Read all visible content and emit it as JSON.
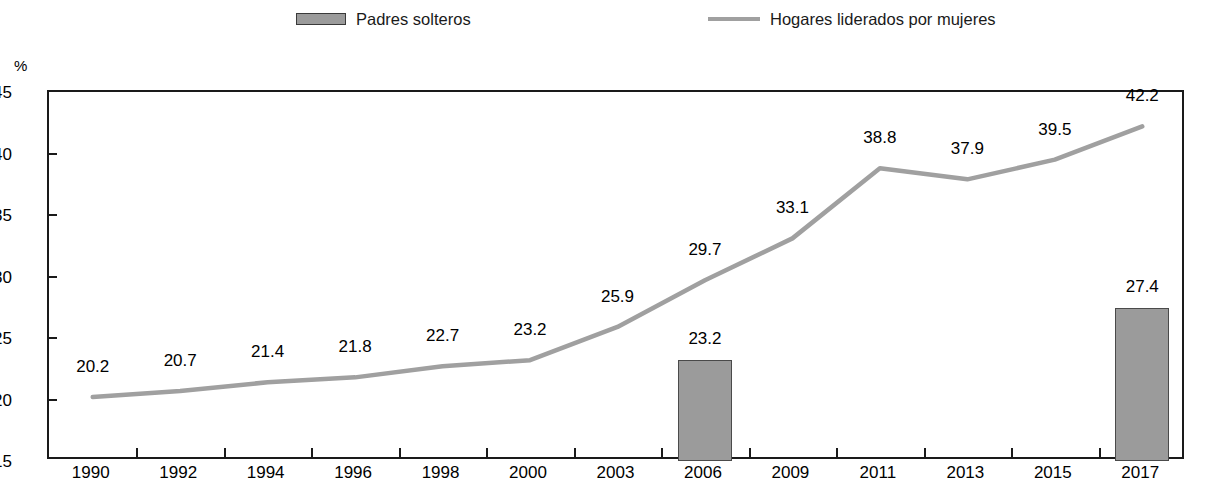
{
  "legend": {
    "entries": [
      {
        "label": "Padres solteros",
        "marker": "bar-swatch-icon",
        "color": "#9b9b9b"
      },
      {
        "label": "Hogares liderados por mujeres",
        "marker": "line-swatch-icon",
        "color": "#a0a0a0"
      }
    ]
  },
  "axis": {
    "unit": "%"
  },
  "chart_data": {
    "type": "bar",
    "title": "",
    "xlabel": "",
    "ylabel": "%",
    "ylim": [
      15,
      45
    ],
    "ytick_step": 5,
    "ytick_labels": [
      "45",
      "40",
      "35",
      "30",
      "25",
      "20",
      "15"
    ],
    "grid": false,
    "legend_position": "top",
    "categories": [
      "1990",
      "1992",
      "1994",
      "1996",
      "1998",
      "2000",
      "2003",
      "2006",
      "2009",
      "2011",
      "2013",
      "2015",
      "2017"
    ],
    "series": [
      {
        "name": "Padres solteros",
        "type": "bar",
        "color": "#9b9b9b",
        "values": [
          null,
          null,
          null,
          null,
          null,
          null,
          null,
          23.2,
          null,
          null,
          null,
          null,
          27.4
        ],
        "labels": [
          "",
          "",
          "",
          "",
          "",
          "",
          "",
          "23.2",
          "",
          "",
          "",
          "",
          "27.4"
        ]
      },
      {
        "name": "Hogares liderados por mujeres",
        "type": "line",
        "color": "#a0a0a0",
        "values": [
          20.2,
          20.7,
          21.4,
          21.8,
          22.7,
          23.2,
          25.9,
          29.7,
          33.1,
          38.8,
          37.9,
          39.5,
          42.2
        ],
        "labels": [
          "20.2",
          "20.7",
          "21.4",
          "21.8",
          "22.7",
          "23.2",
          "25.9",
          "29.7",
          "33.1",
          "38.8",
          "37.9",
          "39.5",
          "42.2"
        ]
      }
    ]
  }
}
